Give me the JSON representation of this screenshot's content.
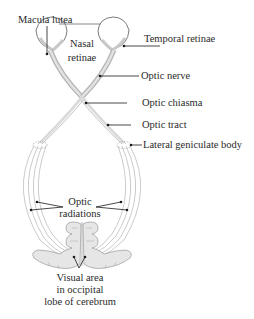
{
  "diagram": {
    "type": "anatomical-visual-pathway",
    "labels": {
      "macula_lutea": "Macula lutea",
      "nasal_retinae_1": "Nasal",
      "nasal_retinae_2": "retinae",
      "temporal_retinae": "Temporal retinae",
      "optic_nerve": "Optic nerve",
      "optic_chiasma": "Optic chiasma",
      "optic_tract": "Optic tract",
      "lateral_geniculate_body": "Lateral geniculate body",
      "optic_radiations_1": "Optic",
      "optic_radiations_2": "radiations",
      "visual_area_1": "Visual area",
      "visual_area_2": "in occipital",
      "visual_area_3": "lobe of cerebrum"
    },
    "colors": {
      "stroke": "#6e6e6e",
      "fill_light": "#e8e8e8",
      "fill_mid": "#cfcfcf",
      "text": "#2a2a2a",
      "leader": "#1a1a1a"
    }
  }
}
